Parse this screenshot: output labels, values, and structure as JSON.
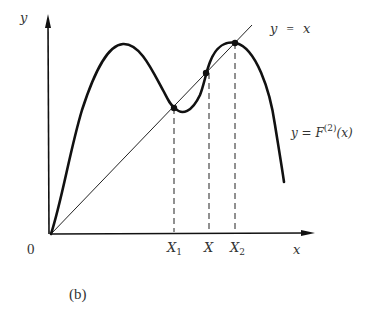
{
  "figure": {
    "caption": "(b)",
    "axes": {
      "x_label": "x",
      "y_label": "y",
      "origin_label": "0"
    },
    "curves": {
      "identity_label_left": "y",
      "identity_label_eq": "=",
      "identity_label_right": "x",
      "map_label_prefix": "y = F",
      "map_label_sup": "(2)",
      "map_label_suffix": "(x)"
    },
    "x_ticks": [
      {
        "base": "X",
        "sub": "1"
      },
      {
        "base": "X",
        "sub": ""
      },
      {
        "base": "X",
        "sub": "2"
      }
    ],
    "fixed_points": [
      {
        "name": "X1",
        "x": 174,
        "y": 108
      },
      {
        "name": "X",
        "x": 206,
        "y": 73
      },
      {
        "name": "X2",
        "x": 235,
        "y": 43
      }
    ],
    "colors": {
      "ink": "#111111",
      "text": "#333333",
      "background": "#ffffff"
    }
  }
}
